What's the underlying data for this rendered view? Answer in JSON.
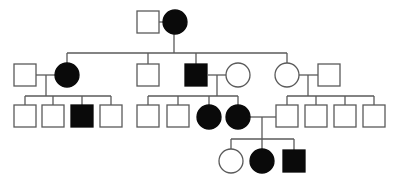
{
  "diagram": {
    "type": "pedigree",
    "colors": {
      "line": "#5a5a5a",
      "affected": "#0a0a0a",
      "unaffected": "#ffffff",
      "background": "#ffffff"
    },
    "individuals": [
      {
        "id": "I-1",
        "generation": 1,
        "sex": "male",
        "affected": false,
        "shape": "square",
        "x": 137,
        "y": 11
      },
      {
        "id": "I-2",
        "generation": 1,
        "sex": "female",
        "affected": true,
        "shape": "circle",
        "cx": 175,
        "cy": 22
      },
      {
        "id": "II-1",
        "generation": 2,
        "sex": "male",
        "affected": false,
        "shape": "square",
        "x": 14,
        "y": 64
      },
      {
        "id": "II-2",
        "generation": 2,
        "sex": "female",
        "affected": true,
        "shape": "circle",
        "cx": 67,
        "cy": 75
      },
      {
        "id": "II-3",
        "generation": 2,
        "sex": "male",
        "affected": false,
        "shape": "square",
        "x": 137,
        "y": 64
      },
      {
        "id": "II-4",
        "generation": 2,
        "sex": "male",
        "affected": true,
        "shape": "square",
        "x": 185,
        "y": 64
      },
      {
        "id": "II-5",
        "generation": 2,
        "sex": "female",
        "affected": false,
        "shape": "circle",
        "cx": 238,
        "cy": 75
      },
      {
        "id": "II-6",
        "generation": 2,
        "sex": "female",
        "affected": false,
        "shape": "circle",
        "cx": 287,
        "cy": 75
      },
      {
        "id": "II-7",
        "generation": 2,
        "sex": "male",
        "affected": false,
        "shape": "square",
        "x": 318,
        "y": 64
      },
      {
        "id": "III-1",
        "generation": 3,
        "sex": "male",
        "affected": false,
        "shape": "square",
        "x": 14,
        "y": 105
      },
      {
        "id": "III-2",
        "generation": 3,
        "sex": "male",
        "affected": false,
        "shape": "square",
        "x": 42,
        "y": 105
      },
      {
        "id": "III-3",
        "generation": 3,
        "sex": "male",
        "affected": true,
        "shape": "square",
        "x": 71,
        "y": 105
      },
      {
        "id": "III-4",
        "generation": 3,
        "sex": "male",
        "affected": false,
        "shape": "square",
        "x": 100,
        "y": 105
      },
      {
        "id": "III-5",
        "generation": 3,
        "sex": "male",
        "affected": false,
        "shape": "square",
        "x": 137,
        "y": 105
      },
      {
        "id": "III-6",
        "generation": 3,
        "sex": "male",
        "affected": false,
        "shape": "square",
        "x": 167,
        "y": 105
      },
      {
        "id": "III-7",
        "generation": 3,
        "sex": "female",
        "affected": true,
        "shape": "circle",
        "cx": 209,
        "cy": 117
      },
      {
        "id": "III-8",
        "generation": 3,
        "sex": "female",
        "affected": true,
        "shape": "circle",
        "cx": 238,
        "cy": 117
      },
      {
        "id": "III-9",
        "generation": 3,
        "sex": "male",
        "affected": false,
        "shape": "square",
        "x": 276,
        "y": 105
      },
      {
        "id": "III-10",
        "generation": 3,
        "sex": "male",
        "affected": false,
        "shape": "square",
        "x": 305,
        "y": 105
      },
      {
        "id": "III-11",
        "generation": 3,
        "sex": "male",
        "affected": false,
        "shape": "square",
        "x": 334,
        "y": 105
      },
      {
        "id": "III-12",
        "generation": 3,
        "sex": "male",
        "affected": false,
        "shape": "square",
        "x": 363,
        "y": 105
      },
      {
        "id": "IV-1",
        "generation": 4,
        "sex": "female",
        "affected": false,
        "shape": "circle",
        "cx": 231,
        "cy": 161
      },
      {
        "id": "IV-2",
        "generation": 4,
        "sex": "female",
        "affected": true,
        "shape": "circle",
        "cx": 262,
        "cy": 161
      },
      {
        "id": "IV-3",
        "generation": 4,
        "sex": "male",
        "affected": true,
        "shape": "square",
        "x": 283,
        "y": 150
      }
    ],
    "lines": [
      {
        "id": "mate-I",
        "x1": 159,
        "y1": 22,
        "x2": 163,
        "y2": 22
      },
      {
        "id": "desc-I",
        "x1": 174,
        "y1": 22,
        "x2": 174,
        "y2": 53
      },
      {
        "id": "sibs-II",
        "x1": 67,
        "y1": 53,
        "x2": 287,
        "y2": 53
      },
      {
        "id": "drop-II-2",
        "x1": 67,
        "y1": 53,
        "x2": 67,
        "y2": 63
      },
      {
        "id": "drop-II-3",
        "x1": 148,
        "y1": 53,
        "x2": 148,
        "y2": 64
      },
      {
        "id": "drop-II-4",
        "x1": 196,
        "y1": 53,
        "x2": 196,
        "y2": 64
      },
      {
        "id": "drop-II-6",
        "x1": 287,
        "y1": 53,
        "x2": 287,
        "y2": 63
      },
      {
        "id": "mate-II-1-2",
        "x1": 36,
        "y1": 75,
        "x2": 55,
        "y2": 75
      },
      {
        "id": "desc-II-1-2",
        "x1": 46,
        "y1": 75,
        "x2": 46,
        "y2": 96
      },
      {
        "id": "sibs-III-a",
        "x1": 25,
        "y1": 96,
        "x2": 111,
        "y2": 96
      },
      {
        "id": "drop-III-1",
        "x1": 25,
        "y1": 96,
        "x2": 25,
        "y2": 105
      },
      {
        "id": "drop-III-2",
        "x1": 53,
        "y1": 96,
        "x2": 53,
        "y2": 105
      },
      {
        "id": "drop-III-3",
        "x1": 82,
        "y1": 96,
        "x2": 82,
        "y2": 105
      },
      {
        "id": "drop-III-4",
        "x1": 111,
        "y1": 96,
        "x2": 111,
        "y2": 105
      },
      {
        "id": "mate-II-4-5",
        "x1": 208,
        "y1": 75,
        "x2": 226,
        "y2": 75
      },
      {
        "id": "desc-II-4-5",
        "x1": 217,
        "y1": 75,
        "x2": 217,
        "y2": 96
      },
      {
        "id": "sibs-III-b",
        "x1": 148,
        "y1": 96,
        "x2": 238,
        "y2": 96
      },
      {
        "id": "drop-III-5",
        "x1": 148,
        "y1": 96,
        "x2": 148,
        "y2": 105
      },
      {
        "id": "drop-III-6",
        "x1": 178,
        "y1": 96,
        "x2": 178,
        "y2": 105
      },
      {
        "id": "drop-III-7",
        "x1": 209,
        "y1": 96,
        "x2": 209,
        "y2": 105
      },
      {
        "id": "drop-III-8",
        "x1": 238,
        "y1": 96,
        "x2": 238,
        "y2": 105
      },
      {
        "id": "mate-II-6-7",
        "x1": 299,
        "y1": 75,
        "x2": 318,
        "y2": 75
      },
      {
        "id": "desc-II-6-7",
        "x1": 308,
        "y1": 75,
        "x2": 308,
        "y2": 96
      },
      {
        "id": "sibs-III-c",
        "x1": 287,
        "y1": 96,
        "x2": 374,
        "y2": 96
      },
      {
        "id": "drop-III-9",
        "x1": 287,
        "y1": 96,
        "x2": 287,
        "y2": 105
      },
      {
        "id": "drop-III-10",
        "x1": 316,
        "y1": 96,
        "x2": 316,
        "y2": 105
      },
      {
        "id": "drop-III-11",
        "x1": 345,
        "y1": 96,
        "x2": 345,
        "y2": 105
      },
      {
        "id": "drop-III-12",
        "x1": 374,
        "y1": 96,
        "x2": 374,
        "y2": 105
      },
      {
        "id": "mate-III-8-9",
        "x1": 250,
        "y1": 117,
        "x2": 276,
        "y2": 117
      },
      {
        "id": "desc-III-8-9",
        "x1": 262,
        "y1": 117,
        "x2": 262,
        "y2": 139
      },
      {
        "id": "sibs-IV",
        "x1": 231,
        "y1": 139,
        "x2": 294,
        "y2": 139
      },
      {
        "id": "drop-IV-1",
        "x1": 231,
        "y1": 139,
        "x2": 231,
        "y2": 149
      },
      {
        "id": "drop-IV-2",
        "x1": 262,
        "y1": 139,
        "x2": 262,
        "y2": 149
      },
      {
        "id": "drop-IV-3",
        "x1": 294,
        "y1": 139,
        "x2": 294,
        "y2": 150
      }
    ],
    "symbol": {
      "square_size": 22,
      "circle_radius": 12
    }
  }
}
